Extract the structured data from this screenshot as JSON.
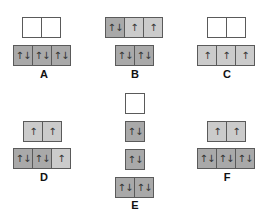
{
  "diagrams": [
    {
      "id": "A",
      "label": "A",
      "label_pos": [
        34,
        68
      ],
      "rows": [
        {
          "x": 22,
          "y": 17,
          "cells": [
            {
              "fill": "empty",
              "spin": ""
            },
            {
              "fill": "empty",
              "spin": ""
            }
          ]
        },
        {
          "x": 13,
          "y": 45,
          "cells": [
            {
              "fill": "full",
              "spin": "↑↓"
            },
            {
              "fill": "full",
              "spin": "↑↓"
            },
            {
              "fill": "full",
              "spin": "↑↓"
            }
          ]
        }
      ]
    },
    {
      "id": "B",
      "label": "B",
      "label_pos": [
        125,
        68
      ],
      "rows": [
        {
          "x": 105,
          "y": 17,
          "cells": [
            {
              "fill": "full",
              "spin": "↑↓"
            },
            {
              "fill": "half",
              "spin": "↑"
            },
            {
              "fill": "half",
              "spin": "↑"
            }
          ]
        },
        {
          "x": 115,
          "y": 45,
          "cells": [
            {
              "fill": "full",
              "spin": "↑↓"
            },
            {
              "fill": "full",
              "spin": "↑↓"
            }
          ]
        }
      ]
    },
    {
      "id": "C",
      "label": "C",
      "label_pos": [
        217,
        68
      ],
      "rows": [
        {
          "x": 207,
          "y": 17,
          "cells": [
            {
              "fill": "empty",
              "spin": ""
            },
            {
              "fill": "empty",
              "spin": ""
            }
          ]
        },
        {
          "x": 197,
          "y": 45,
          "cells": [
            {
              "fill": "half",
              "spin": "↑"
            },
            {
              "fill": "half",
              "spin": "↑"
            },
            {
              "fill": "half",
              "spin": "↑"
            }
          ]
        }
      ]
    },
    {
      "id": "D",
      "label": "D",
      "label_pos": [
        34,
        171
      ],
      "rows": [
        {
          "x": 23,
          "y": 121,
          "cells": [
            {
              "fill": "half",
              "spin": "↑"
            },
            {
              "fill": "half",
              "spin": "↑"
            }
          ]
        },
        {
          "x": 13,
          "y": 148,
          "cells": [
            {
              "fill": "full",
              "spin": "↑↓"
            },
            {
              "fill": "full",
              "spin": "↑↓"
            },
            {
              "fill": "half",
              "spin": "↑"
            }
          ]
        }
      ]
    },
    {
      "id": "E",
      "label": "E",
      "label_pos": [
        125,
        199
      ],
      "rows": [
        {
          "x": 125,
          "y": 93,
          "cells": [
            {
              "fill": "empty",
              "spin": ""
            }
          ]
        },
        {
          "x": 125,
          "y": 121,
          "cells": [
            {
              "fill": "full",
              "spin": "↑↓"
            }
          ]
        },
        {
          "x": 125,
          "y": 149,
          "cells": [
            {
              "fill": "full",
              "spin": "↑↓"
            }
          ]
        },
        {
          "x": 115,
          "y": 177,
          "cells": [
            {
              "fill": "full",
              "spin": "↑↓"
            },
            {
              "fill": "full",
              "spin": "↑↓"
            }
          ]
        }
      ]
    },
    {
      "id": "F",
      "label": "F",
      "label_pos": [
        217,
        171
      ],
      "rows": [
        {
          "x": 207,
          "y": 121,
          "cells": [
            {
              "fill": "half",
              "spin": "↑"
            },
            {
              "fill": "half",
              "spin": "↑"
            }
          ]
        },
        {
          "x": 197,
          "y": 148,
          "cells": [
            {
              "fill": "full",
              "spin": "↑↓"
            },
            {
              "fill": "full",
              "spin": "↑↓"
            },
            {
              "fill": "full",
              "spin": "↑↓"
            }
          ]
        }
      ]
    }
  ],
  "colors": {
    "empty": "#ffffff",
    "half_filled": "#cbcbcb",
    "full_filled": "#a9a9a9",
    "border": "#5a5a5a"
  }
}
